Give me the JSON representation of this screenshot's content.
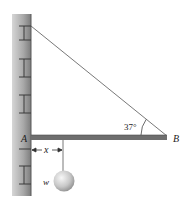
{
  "diagram": {
    "type": "statics-beam-cable",
    "labels": {
      "wall_point": "A",
      "beam_end": "B",
      "distance": "x",
      "weight": "w",
      "angle": "37°"
    },
    "colors": {
      "wall_light": "#c8c8c8",
      "wall_dark": "#8c8c8c",
      "mortar": "#3a3a3a",
      "beam": "#6e6e6e",
      "cable": "#555555",
      "ball_light": "#f2f2f2",
      "ball_dark": "#9a9a9a"
    }
  }
}
